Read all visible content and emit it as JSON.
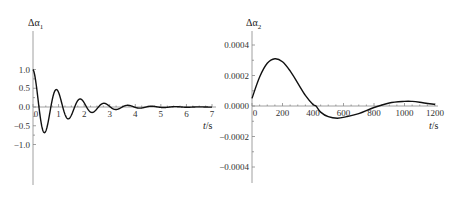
{
  "chart_data": [
    {
      "type": "line",
      "title": "",
      "ylabel": "Δα1",
      "xlabel": "t/s",
      "xlim": [
        0,
        7
      ],
      "ylim": [
        -1.0,
        1.0
      ],
      "xticks": [
        0,
        1,
        2,
        3,
        4,
        5,
        6,
        7
      ],
      "xtick_labels": [
        "0",
        "1",
        "2",
        "3",
        "4",
        "5",
        "6",
        "7"
      ],
      "yticks": [
        1.0,
        0.5,
        0.0,
        -0.5,
        -1.0
      ],
      "ytick_labels": [
        "1.0",
        "0.5",
        "0.0",
        "−0.5",
        "−1.0"
      ],
      "grid": false,
      "legend": null,
      "description": "Damped oscillation starting at 1.0, decaying to ~0 by t≈5 s",
      "series": [
        {
          "name": "Δα1",
          "x": [
            0,
            0.42,
            0.9,
            1.35,
            1.85,
            2.35,
            2.8,
            3.3,
            3.75,
            4.25,
            4.7,
            5.2,
            5.7,
            6.2,
            7.0
          ],
          "y": [
            1.0,
            -0.67,
            0.46,
            -0.31,
            0.21,
            -0.14,
            0.1,
            -0.06,
            0.05,
            -0.03,
            0.02,
            -0.01,
            0.01,
            0.0,
            0.0
          ]
        }
      ],
      "model": {
        "form": "exp(-k t) cos(w t)",
        "k": 0.83,
        "w": 6.75
      }
    },
    {
      "type": "line",
      "title": "",
      "ylabel": "Δα2",
      "xlabel": "t/s",
      "xlim": [
        0,
        1200
      ],
      "ylim": [
        -0.0005,
        0.0005
      ],
      "xticks": [
        0,
        200,
        400,
        600,
        800,
        1000,
        1200
      ],
      "xtick_labels": [
        "0",
        "200",
        "400",
        "600",
        "800",
        "1000",
        "1200"
      ],
      "yticks": [
        0.0004,
        0.0002,
        0.0,
        -0.0002,
        -0.0004
      ],
      "ytick_labels": [
        "0.0004",
        "0.0002",
        "0.0000",
        "−0.0002",
        "−0.0004"
      ],
      "grid": false,
      "legend": null,
      "series": [
        {
          "name": "Δα2",
          "x": [
            0,
            50,
            100,
            150,
            200,
            250,
            300,
            350,
            400,
            420,
            450,
            500,
            560,
            620,
            700,
            800,
            900,
            1000,
            1050,
            1100,
            1200
          ],
          "y": [
            5e-05,
            0.00019,
            0.00028,
            0.00031,
            0.00029,
            0.00023,
            0.00015,
            7e-05,
            1e-05,
            0.0,
            -4e-05,
            -7e-05,
            -8e-05,
            -7e-05,
            -5e-05,
            -1e-05,
            2e-05,
            3e-05,
            3e-05,
            2.5e-05,
            1e-05
          ]
        }
      ]
    }
  ],
  "labels": {
    "left_ylabel_main": "Δα",
    "left_ylabel_sub": "1",
    "right_ylabel_main": "Δα",
    "right_ylabel_sub": "2",
    "xlabel_italic": "t",
    "xlabel_unit": "/s"
  }
}
